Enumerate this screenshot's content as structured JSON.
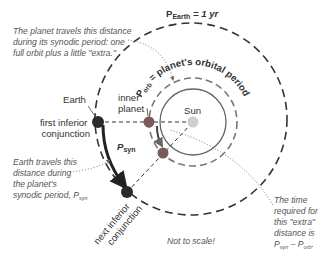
{
  "diagram": {
    "title_earth_period": {
      "main": "P",
      "sub": "Earth",
      "rest": " = 1 yr"
    },
    "porb_label": {
      "main": "P",
      "sub": "orb",
      "rest": " = planet's orbital period"
    },
    "labels": {
      "earth": "Earth",
      "first_conjunction_line1": "first inferior",
      "first_conjunction_line2": "conjunction",
      "inner_planet_line1": "inner",
      "inner_planet_line2": "planet",
      "sun": "Sun",
      "psyn_main": "P",
      "psyn_sub": "syn",
      "next_conjunction_line1": "next inferior",
      "next_conjunction_line2": "conjunction",
      "not_to_scale": "Not to scale!"
    },
    "notes": {
      "planet_travel": [
        "The planet travels this distance",
        "during its synodic period: one",
        "full orbit plus a little \"extra.\""
      ],
      "earth_travel": [
        "Earth travels this",
        "distance during",
        "the planet's",
        "synodic period, P"
      ],
      "earth_travel_sub": "syn",
      "extra_time": [
        "The time",
        "required for",
        "this \"extra\"",
        "distance is"
      ],
      "extra_time_formula": {
        "a": "P",
        "a_sub": "syn",
        "op": " – ",
        "b": "P",
        "b_sub": "orb",
        "end": "."
      }
    },
    "colors": {
      "earth_dot": "#2b2b2b",
      "planet_dot": "#7a5a5a",
      "sun_dot": "#cfcfcf",
      "orbit_line": "#333333",
      "planet_orbit": "#777777",
      "text_gray": "#555555"
    }
  }
}
